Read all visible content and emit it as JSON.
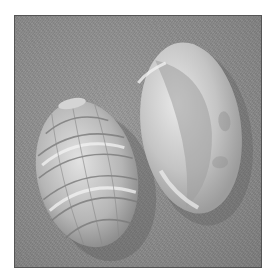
{
  "image": {
    "subject": "Two seashells on a textured gray surface",
    "shells": [
      {
        "name": "ribbed-shell",
        "description": "Ribbed helmet shell showing exterior with light and dark bands"
      },
      {
        "name": "smooth-shell",
        "description": "Smooth glossy shell showing aperture side"
      }
    ],
    "colors": {
      "background": "#8c8c8c",
      "frame_border": "#555555",
      "page": "#ffffff"
    }
  }
}
